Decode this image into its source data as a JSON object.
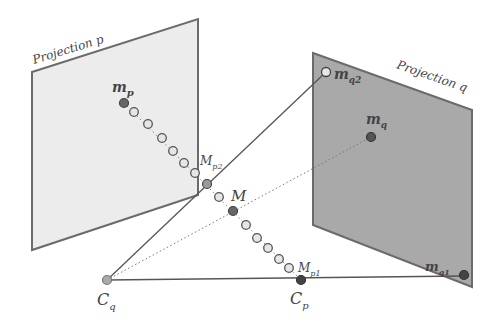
{
  "diagram": {
    "colors": {
      "plane_p_fill": "#ececec",
      "plane_q_fill": "#a9a9a9",
      "edge": "#6b6b6b",
      "dark_point": "#5a5a5a",
      "light_point": "#e6e6e6"
    },
    "planes": [
      {
        "id": "p",
        "label": "Projection p",
        "corners": [
          [
            32,
            72
          ],
          [
            198,
            19
          ],
          [
            198,
            195
          ],
          [
            32,
            250
          ]
        ]
      },
      {
        "id": "q",
        "label": "Projection q",
        "corners": [
          [
            313,
            53
          ],
          [
            472,
            110
          ],
          [
            472,
            287
          ],
          [
            313,
            225
          ]
        ]
      }
    ],
    "labels": {
      "projection_p": "Projection p",
      "projection_q": "Projection q",
      "m_p": "m",
      "m_p_sub": "p",
      "M_p2": "M",
      "M_p2_sub": "p2",
      "M": "M",
      "M_p1": "M",
      "M_p1_sub": "p1",
      "C_q": "C",
      "C_q_sub": "q",
      "C_p": "C",
      "C_p_sub": "p",
      "m_q2": "m",
      "m_q2_sub": "q2",
      "m_q": "m",
      "m_q_sub": "q",
      "m_q1": "m",
      "m_q1_sub": "q1"
    },
    "points": {
      "m_p": [
        124,
        103
      ],
      "M_p2": [
        207,
        184
      ],
      "M": [
        233,
        211
      ],
      "M_p1": [
        289,
        268
      ],
      "C_q": [
        107,
        280
      ],
      "C_p": [
        301,
        280
      ],
      "m_q2": [
        326,
        72
      ],
      "m_q": [
        371,
        137
      ],
      "m_q1": [
        464,
        275
      ]
    },
    "intermediate_points": [
      [
        134,
        112
      ],
      [
        148,
        124
      ],
      [
        162,
        138
      ],
      [
        173,
        151
      ],
      [
        184,
        163
      ],
      [
        195,
        173
      ],
      [
        219,
        197
      ],
      [
        246,
        225
      ],
      [
        257,
        238
      ],
      [
        268,
        248
      ],
      [
        279,
        259
      ]
    ]
  }
}
